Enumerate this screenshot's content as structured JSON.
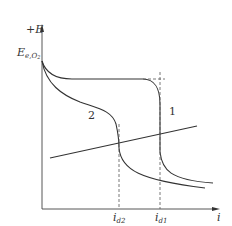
{
  "diagram": {
    "title": "",
    "axes": {
      "y_label": "+E",
      "x_label": "i",
      "y_marker": {
        "base": "E",
        "sub": "e,O",
        "sub2": "2"
      }
    },
    "x_ticks": [
      {
        "base": "i",
        "sub": "d2"
      },
      {
        "base": "i",
        "sub": "d1"
      }
    ],
    "curves": [
      {
        "label": "1",
        "description": "polarization curve with limiting current i_d1"
      },
      {
        "label": "2",
        "description": "polarization curve with limiting current i_d2"
      }
    ],
    "colors": {
      "line": "#333333",
      "dashed": "#555555",
      "background": "#ffffff"
    }
  }
}
